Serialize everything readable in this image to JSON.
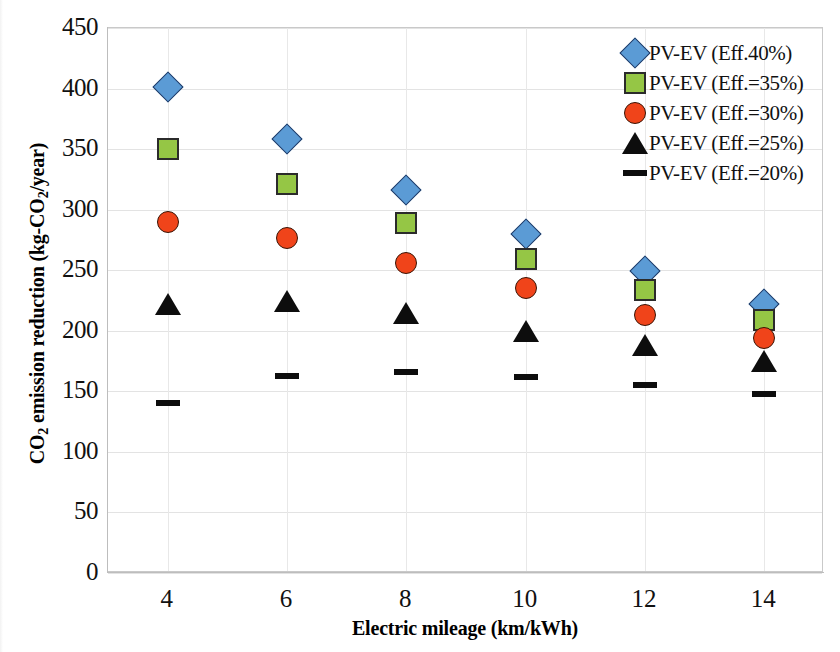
{
  "chart_data": {
    "type": "scatter",
    "title": "",
    "xlabel": "Electric mileage (km/kWh)",
    "ylabel": "CO2 emission reduction (kg-CO2/year)",
    "x": [
      4,
      6,
      8,
      10,
      12,
      14
    ],
    "xticks": [
      "4",
      "6",
      "8",
      "10",
      "12",
      "14"
    ],
    "yticks": [
      "0",
      "50",
      "100",
      "150",
      "200",
      "250",
      "300",
      "350",
      "400",
      "450"
    ],
    "xlim": [
      3,
      15
    ],
    "ylim": [
      0,
      450
    ],
    "grid": "horizontal-and-vertical",
    "legend_position": "top-right",
    "series": [
      {
        "name": "PV-EV (Eff.40%)",
        "marker": "diamond",
        "color": "#5B9BD5",
        "border_color": "#1F3864",
        "values": [
          401,
          358,
          316,
          280,
          249,
          222
        ]
      },
      {
        "name": "PV-EV (Eff.=35%)",
        "marker": "square",
        "color": "#95C645",
        "border_color": "#2B2B2B",
        "values": [
          350,
          321,
          289,
          259,
          234,
          209
        ]
      },
      {
        "name": "PV-EV (Eff.=30%)",
        "marker": "circle",
        "color": "#F0441A",
        "border_color": "#3A1405",
        "values": [
          290,
          277,
          256,
          235,
          213,
          194
        ]
      },
      {
        "name": "PV-EV (Eff.=25%)",
        "marker": "triangle",
        "color": "#0D0D0D",
        "border_color": "#0D0D0D",
        "values": [
          222,
          225,
          215,
          200,
          188,
          175
        ]
      },
      {
        "name": "PV-EV (Eff.=20%)",
        "marker": "dash",
        "color": "#0D0D0D",
        "border_color": "#0D0D0D",
        "values": [
          140,
          163,
          166,
          162,
          155,
          148
        ]
      }
    ]
  },
  "axis": {
    "y_title_main": "CO",
    "y_title_sub1": "2",
    "y_title_mid": " emission reduction (kg-CO",
    "y_title_sub2": "2",
    "y_title_end": "/year)",
    "x_title": "Electric mileage (km/kWh)"
  }
}
